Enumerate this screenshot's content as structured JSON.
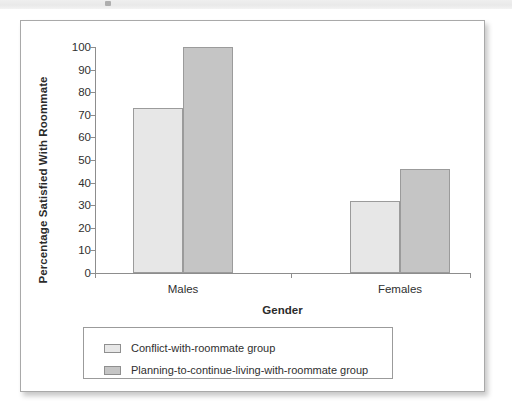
{
  "page": {
    "header_strip_color": "#ececec",
    "panel_border_color": "#a9a9a9"
  },
  "chart_data": {
    "type": "bar",
    "title": "",
    "xlabel": "Gender",
    "ylabel": "Percentage Satisfied With Roommate",
    "categories": [
      "Males",
      "Females"
    ],
    "series": [
      {
        "name": "Conflict-with-roommate group",
        "color": "#e7e7e7",
        "values": [
          73,
          32
        ]
      },
      {
        "name": "Planning-to-continue-living-with-roommate group",
        "color": "#c5c5c5",
        "values": [
          100,
          46
        ]
      }
    ],
    "ylim": [
      0,
      100
    ],
    "ytick_step": 10,
    "yticks": [
      "100",
      "90",
      "80",
      "70",
      "60",
      "50",
      "40",
      "30",
      "20",
      "10",
      "0"
    ],
    "grid": false,
    "legend_position": "bottom"
  }
}
